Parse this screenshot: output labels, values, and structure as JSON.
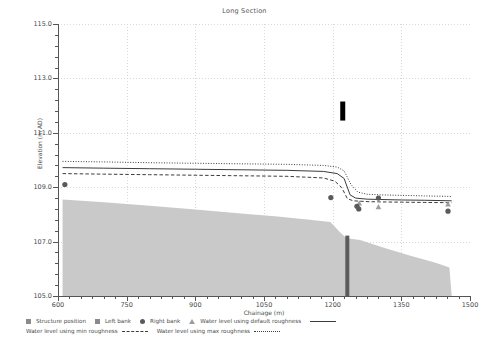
{
  "chart_data": {
    "type": "line",
    "title": "Long Section",
    "xlabel": "Chainage (m)",
    "ylabel": "Elevation (m AD)",
    "xlim": [
      600,
      1500
    ],
    "ylim": [
      105.0,
      115.0
    ],
    "xticks": [
      600,
      750,
      900,
      1050,
      1200,
      1350,
      1500
    ],
    "xtick_labels": [
      "600",
      "750",
      "900",
      "1050",
      "1200",
      "1350",
      "1500"
    ],
    "yticks": [
      105.0,
      107.0,
      109.0,
      111.0,
      113.0,
      115.0
    ],
    "ytick_labels": [
      "105.0",
      "107.0",
      "109.0",
      "111.0",
      "113.0",
      "115.0"
    ],
    "x_minor_step": 25,
    "y_minor_step": 0.4,
    "grid": true,
    "legend_position": "below",
    "series": [
      {
        "name": "Water level using max roughness",
        "style": "dotted",
        "color": "#3c3c3c",
        "x": [
          610,
          700,
          800,
          900,
          1000,
          1100,
          1180,
          1210,
          1225,
          1240,
          1255,
          1275,
          1300,
          1350,
          1400,
          1460
        ],
        "y": [
          109.95,
          109.93,
          109.9,
          109.88,
          109.86,
          109.84,
          109.8,
          109.74,
          109.6,
          109.1,
          108.82,
          108.74,
          108.72,
          108.7,
          108.68,
          108.66
        ]
      },
      {
        "name": "Water level using default roughness",
        "style": "solid",
        "color": "#3c3c3c",
        "x": [
          610,
          700,
          800,
          900,
          1000,
          1100,
          1180,
          1210,
          1225,
          1238,
          1250,
          1275,
          1300,
          1350,
          1400,
          1460
        ],
        "y": [
          109.72,
          109.7,
          109.68,
          109.66,
          109.64,
          109.62,
          109.58,
          109.5,
          109.32,
          108.72,
          108.6,
          108.56,
          108.55,
          108.53,
          108.52,
          108.5
        ]
      },
      {
        "name": "Water level using min roughness",
        "style": "dashed",
        "color": "#3c3c3c",
        "x": [
          610,
          700,
          800,
          900,
          1000,
          1100,
          1180,
          1205,
          1220,
          1232,
          1245,
          1275,
          1300,
          1350,
          1400,
          1460
        ],
        "y": [
          109.5,
          109.48,
          109.46,
          109.44,
          109.42,
          109.4,
          109.34,
          109.22,
          108.98,
          108.58,
          108.5,
          108.47,
          108.46,
          108.45,
          108.44,
          108.43
        ]
      },
      {
        "name": "Bed profile",
        "style": "filled-area",
        "color": "#c9c9c9",
        "x": [
          610,
          700,
          800,
          900,
          1000,
          1080,
          1150,
          1195,
          1215,
          1230,
          1260,
          1310,
          1370,
          1425,
          1455,
          1460
        ],
        "y": [
          108.55,
          108.45,
          108.32,
          108.18,
          108.03,
          107.92,
          107.8,
          107.72,
          107.36,
          107.12,
          107.06,
          106.78,
          106.48,
          106.22,
          106.05,
          105.0
        ]
      }
    ],
    "markers": [
      {
        "series": "Left bank",
        "shape": "triangle",
        "color": "#9d9d9d",
        "x": 1258,
        "y": 108.42
      },
      {
        "series": "Left bank",
        "shape": "triangle",
        "color": "#9d9d9d",
        "x": 1300,
        "y": 108.28
      },
      {
        "series": "Left bank",
        "shape": "triangle",
        "color": "#9d9d9d",
        "x": 1452,
        "y": 108.38
      },
      {
        "series": "Right bank",
        "shape": "circle",
        "color": "#5a5a5a",
        "x": 615,
        "y": 109.1
      },
      {
        "series": "Right bank",
        "shape": "circle",
        "color": "#5a5a5a",
        "x": 1196,
        "y": 108.62
      },
      {
        "series": "Right bank",
        "shape": "circle",
        "color": "#5a5a5a",
        "x": 1253,
        "y": 108.3
      },
      {
        "series": "Right bank",
        "shape": "circle",
        "color": "#5a5a5a",
        "x": 1257,
        "y": 108.2
      },
      {
        "series": "Right bank",
        "shape": "circle",
        "color": "#5a5a5a",
        "x": 1300,
        "y": 108.6
      },
      {
        "series": "Right bank",
        "shape": "circle",
        "color": "#5a5a5a",
        "x": 1452,
        "y": 108.12
      }
    ],
    "structures": [
      {
        "name": "Structure position",
        "x": 1222,
        "y_top": 112.15,
        "y_bottom": 111.45,
        "color": "#000000",
        "width_px": 5
      },
      {
        "name": "Structure position",
        "x": 1232,
        "y_top": 107.22,
        "y_bottom": 105.0,
        "color": "#5c5c5c",
        "width_px": 4
      }
    ]
  },
  "legend": {
    "row1": [
      {
        "label": "Structure position",
        "sample": "square-marker"
      },
      {
        "label": "Left bank",
        "sample": "square-marker"
      },
      {
        "label": "Right bank",
        "sample": "circle-marker"
      },
      {
        "label": "Water level using default roughness",
        "sample": "triangle-marker"
      }
    ],
    "row2": [
      {
        "label": "Water level using min roughness",
        "sample": "dashed-line"
      },
      {
        "label": "Water level using max roughness",
        "sample": "dotted-line"
      }
    ]
  }
}
